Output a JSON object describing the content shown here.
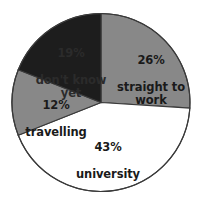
{
  "chart_data": {
    "type": "pie",
    "title": "",
    "subtitle": "",
    "xlabel": "",
    "ylabel": "",
    "legend_position": "none",
    "grid": false,
    "start_angle_deg": 0,
    "direction": "clockwise",
    "categories": [
      "straight to work",
      "university",
      "travelling",
      "don't know yet"
    ],
    "values": [
      26,
      43,
      12,
      19
    ],
    "value_suffix": "%",
    "colors": [
      "#888888",
      "#ffffff",
      "#888888",
      "#1d1d1d"
    ],
    "slices": [
      {
        "label": "straight to work",
        "percent_text": "26%",
        "value": 26,
        "color": "#888888",
        "text_color": "#1a1a1a",
        "start_deg": 0,
        "end_deg": 93.6
      },
      {
        "label": "university",
        "percent_text": "43%",
        "value": 43,
        "color": "#ffffff",
        "text_color": "#1a1a1a",
        "start_deg": 93.6,
        "end_deg": 248.4
      },
      {
        "label": "travelling",
        "percent_text": "12%",
        "value": 12,
        "color": "#888888",
        "text_color": "#1a1a1a",
        "start_deg": 248.4,
        "end_deg": 291.6
      },
      {
        "label": "don't know yet",
        "percent_text": "19%",
        "value": 19,
        "color": "#1d1d1d",
        "text_color": "#2b2b2b",
        "start_deg": 291.6,
        "end_deg": 360
      }
    ]
  },
  "labels": {
    "work": {
      "percent": "26%",
      "name": "straight to\nwork"
    },
    "university": {
      "percent": "43%",
      "name": "university"
    },
    "travelling": {
      "percent": "12%",
      "name": "travelling"
    },
    "dontknow": {
      "percent": "19%",
      "name": "don't know\nyet"
    }
  },
  "style": {
    "background": "#ffffff",
    "outline": "#3a3a3a",
    "gray": "#888888",
    "black": "#1d1d1d",
    "white": "#ffffff"
  }
}
